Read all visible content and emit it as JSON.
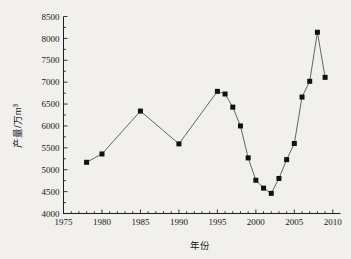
{
  "chart_data": {
    "type": "line",
    "title": "",
    "xlabel": "年份",
    "ylabel": "产量/万m³",
    "ylabel_base": "产量/万m",
    "ylabel_exponent": "3",
    "xlim": [
      1975,
      2011
    ],
    "ylim": [
      4000,
      8500
    ],
    "grid": false,
    "legend": null,
    "marker": "filled-square",
    "line_color": "#4a4a52",
    "marker_color": "#111115",
    "background_color": "#f2f0ec",
    "x_ticks": [
      1975,
      1980,
      1985,
      1990,
      1995,
      2000,
      2005,
      2010
    ],
    "x_tick_labels": [
      "1975",
      "1980",
      "1985",
      "1990",
      "1995",
      "2000",
      "2005",
      "2010"
    ],
    "x_minor_tick_interval": 1,
    "y_ticks": [
      4000,
      4500,
      5000,
      5500,
      6000,
      6500,
      7000,
      7500,
      8000,
      8500
    ],
    "y_tick_labels": [
      "4000",
      "4500",
      "5000",
      "5500",
      "6000",
      "6500",
      "7000",
      "7500",
      "8000",
      "8500"
    ],
    "x": [
      1978,
      1980,
      1985,
      1990,
      1995,
      1996,
      1997,
      1998,
      1999,
      2000,
      2001,
      2002,
      2003,
      2004,
      2005,
      2006,
      2007,
      2008,
      2009
    ],
    "values": [
      5170,
      5360,
      6340,
      5590,
      6790,
      6730,
      6430,
      6000,
      5270,
      4760,
      4580,
      4460,
      4800,
      5230,
      5600,
      6660,
      7020,
      8140,
      7110
    ],
    "series": [
      {
        "name": "产量",
        "points": [
          {
            "x": 1978,
            "y": 5170
          },
          {
            "x": 1980,
            "y": 5360
          },
          {
            "x": 1985,
            "y": 6340
          },
          {
            "x": 1990,
            "y": 5590
          },
          {
            "x": 1995,
            "y": 6790
          },
          {
            "x": 1996,
            "y": 6730
          },
          {
            "x": 1997,
            "y": 6430
          },
          {
            "x": 1998,
            "y": 6000
          },
          {
            "x": 1999,
            "y": 5270
          },
          {
            "x": 2000,
            "y": 4760
          },
          {
            "x": 2001,
            "y": 4580
          },
          {
            "x": 2002,
            "y": 4460
          },
          {
            "x": 2003,
            "y": 4800
          },
          {
            "x": 2004,
            "y": 5230
          },
          {
            "x": 2005,
            "y": 5600
          },
          {
            "x": 2006,
            "y": 6660
          },
          {
            "x": 2007,
            "y": 7020
          },
          {
            "x": 2008,
            "y": 8140
          },
          {
            "x": 2009,
            "y": 7110
          }
        ]
      }
    ]
  }
}
